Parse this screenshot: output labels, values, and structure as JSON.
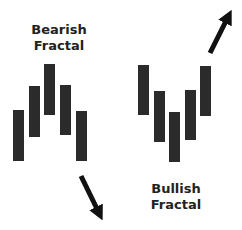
{
  "diagram": {
    "bar_color": "#2b2b2b",
    "arrow_color": "#111111",
    "text_color": "#222222",
    "bearish": {
      "label_line1": "Bearish",
      "label_line2": "Fractal",
      "bars": [
        {
          "x": 13,
          "top": 110,
          "bottom": 161
        },
        {
          "x": 29,
          "top": 86,
          "bottom": 137
        },
        {
          "x": 44,
          "top": 64,
          "bottom": 115
        },
        {
          "x": 60,
          "top": 85,
          "bottom": 135
        },
        {
          "x": 76,
          "top": 111,
          "bottom": 161
        }
      ],
      "arrow": {
        "direction": "down-right",
        "from": [
          81,
          176
        ],
        "to": [
          103,
          222
        ]
      }
    },
    "bullish": {
      "label_line1": "Bullish",
      "label_line2": "Fractal",
      "bars": [
        {
          "x": 138,
          "top": 65,
          "bottom": 115
        },
        {
          "x": 154,
          "top": 91,
          "bottom": 142
        },
        {
          "x": 169,
          "top": 112,
          "bottom": 162
        },
        {
          "x": 185,
          "top": 90,
          "bottom": 140
        },
        {
          "x": 200,
          "top": 66,
          "bottom": 116
        }
      ],
      "arrow": {
        "direction": "up-right",
        "from": [
          210,
          53
        ],
        "to": [
          233,
          8
        ]
      }
    }
  }
}
